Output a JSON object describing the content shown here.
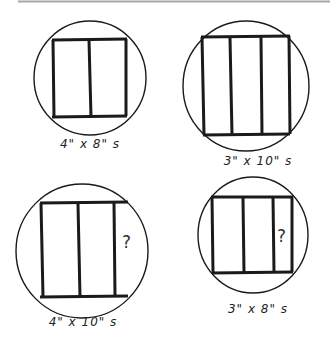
{
  "diagrams": [
    {
      "label": "4\" x 8\" s",
      "question": ""
    },
    {
      "label": "3\" x 10\" s",
      "question": ""
    },
    {
      "label": "4\" x 10\" s",
      "question": "?"
    },
    {
      "label": "3\" x 8\" s",
      "question": "?"
    }
  ],
  "colors": {
    "ink": "#1a1a1a",
    "background": "#ffffff",
    "top_rule": "#9a9a9a"
  }
}
